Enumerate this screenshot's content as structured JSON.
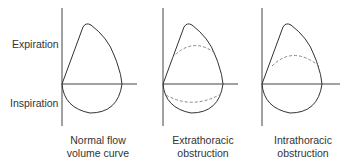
{
  "diagram": {
    "y_labels": {
      "top": "Expiration",
      "bottom": "Inspiration"
    },
    "panels": [
      {
        "caption_line1": "Normal flow",
        "caption_line2": "volume curve",
        "dashed_expiration": false,
        "dashed_inspiration": false
      },
      {
        "caption_line1": "Extrathoracic",
        "caption_line2": "obstruction",
        "dashed_expiration": true,
        "dashed_inspiration": true
      },
      {
        "caption_line1": "Intrathoracic",
        "caption_line2": "obstruction",
        "dashed_expiration": true,
        "dashed_inspiration": false
      }
    ],
    "colors": {
      "line": "#333333",
      "dashed": "#888888"
    }
  }
}
